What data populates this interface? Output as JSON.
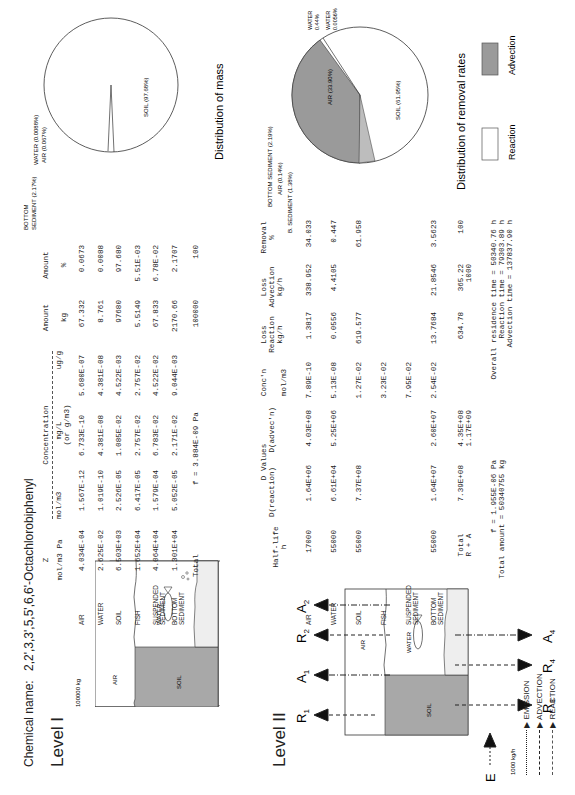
{
  "chemical_name_label": "Chemical name:",
  "chemical_name": "2,2',3,3',5,5',6,6'-Octachlorobiphenyl",
  "level1": {
    "title": "Level I",
    "diagram": {
      "total_label": "100000 kg",
      "compartments": [
        "AIR",
        "WATER",
        "SOIL"
      ]
    },
    "headers": {
      "z": "Z",
      "z_unit": "mol/m3 Pa",
      "concentration": "Concentration",
      "conc_molm3": "mol/m3",
      "conc_mgL": "mg/L",
      "conc_mgL_sub": "(or g/m3)",
      "conc_ugg": "ug/g",
      "amount_kg": "Amount",
      "amount_kg_unit": "kg",
      "amount_pct": "Amount",
      "amount_pct_unit": "%"
    },
    "rows": [
      {
        "name": "AIR",
        "name2": "",
        "z": "4.034E-04",
        "molm3": "1.567E-12",
        "mgL": "6.733E-10",
        "ugg": "5.680E-07",
        "kg": "67.332",
        "pct": "0.0673"
      },
      {
        "name": "WATER",
        "name2": "",
        "z": "2.625E-02",
        "molm3": "1.019E-10",
        "mgL": "4.381E-08",
        "ugg": "4.381E-08",
        "kg": "8.761",
        "pct": "0.0088"
      },
      {
        "name": "SOIL",
        "name2": "",
        "z": "6.503E+03",
        "molm3": "2.526E-05",
        "mgL": "1.085E-02",
        "ugg": "4.522E-03",
        "kg": "97680",
        "pct": "97.680"
      },
      {
        "name": "FISH",
        "name2": "",
        "z": "1.652E+04",
        "molm3": "6.417E-05",
        "mgL": "2.757E-02",
        "ugg": "2.757E-02",
        "kg": "5.5149",
        "pct": "5.51E-03"
      },
      {
        "name": "SUSPENDED",
        "name2": "SEDIMENT",
        "z": "4.064E+04",
        "molm3": "1.579E-04",
        "mgL": "6.783E-02",
        "ugg": "4.522E-02",
        "kg": "67.833",
        "pct": "6.78E-02"
      },
      {
        "name": "BOTTOM",
        "name2": "SEDIMENT",
        "z": "1.301E+04",
        "molm3": "5.052E-05",
        "mgL": "2.171E-02",
        "ugg": "9.044E-03",
        "kg": "2170.66",
        "pct": "2.1707"
      }
    ],
    "total": {
      "label": "Total",
      "f": "f =  3.884E-09 Pa",
      "kg": "100000",
      "pct": "100"
    },
    "pie": {
      "caption": "Distribution of mass",
      "labels": {
        "water": "WATER (0.0088%)",
        "air": "AIR (0.067%)",
        "bottom1": "BOTTOM",
        "bottom2": "SEDIMENT (2.17%)",
        "soil": "SOIL (97.68%)"
      }
    }
  },
  "level2": {
    "title": "Level II",
    "diagram": {
      "emission_label": "1000 kg/h",
      "E": "E",
      "R1": "R",
      "R1_sub": "1",
      "A1": "A",
      "A1_sub": "1",
      "R2": "R",
      "R2_sub": "2",
      "A2": "A",
      "A2_sub": "2",
      "R3": "R",
      "R3_sub": "3",
      "R4": "R",
      "R4_sub": "4",
      "A4": "A",
      "A4_sub": "4",
      "compartments": [
        "AIR",
        "WATER",
        "SOIL"
      ],
      "legend": [
        "EMISSION",
        "ADVECTION",
        "REACTION"
      ]
    },
    "headers": {
      "halflife": "Half-life",
      "halflife_unit": "h",
      "dvalues": "D Values",
      "d_reaction": "D(reaction)",
      "d_advection": "D(advec'n)",
      "conc": "Conc'n",
      "conc_unit": "mol/m3",
      "loss_reaction": "Loss",
      "loss_reaction2": "Reaction",
      "loss_reaction_unit": "kg/h",
      "loss_advection": "Loss",
      "loss_advection2": "Advection",
      "loss_advection_unit": "kg/h",
      "removal": "Removal",
      "removal_unit": "%"
    },
    "rows": [
      {
        "name": "AIR",
        "name2": "",
        "halflife": "17000",
        "dr": "1.64E+06",
        "da": "4.03E+08",
        "conc": "7.89E-10",
        "lr": "1.3817",
        "la": "338.952",
        "rem": "34.033"
      },
      {
        "name": "WATER",
        "name2": "",
        "halflife": "55000",
        "dr": "6.61E+04",
        "da": "5.25E+06",
        "conc": "5.13E-08",
        "lr": "0.0556",
        "la": "4.4105",
        "rem": "0.447"
      },
      {
        "name": "SOIL",
        "name2": "",
        "halflife": "55000",
        "dr": "7.37E+08",
        "da": "",
        "conc": "1.27E-02",
        "lr": "619.577",
        "la": "",
        "rem": "61.958"
      },
      {
        "name": "FISH",
        "name2": "",
        "halflife": "",
        "dr": "",
        "da": "",
        "conc": "3.23E-02",
        "lr": "",
        "la": "",
        "rem": ""
      },
      {
        "name": "SUSPENDED",
        "name2": "SEDIMENT",
        "halflife": "",
        "dr": "",
        "da": "",
        "conc": "7.95E-02",
        "lr": "",
        "la": "",
        "rem": ""
      },
      {
        "name": "BOTTOM",
        "name2": "SEDIMENT",
        "halflife": "55000",
        "dr": "1.64E+07",
        "da": "2.60E+07",
        "conc": "2.54E-02",
        "lr": "13.7684",
        "la": "21.8546",
        "rem": "3.5623"
      }
    ],
    "total": {
      "label": "Total",
      "label2": "R + A",
      "dr": "7.39E+08",
      "da": "4.35E+08",
      "sum": "1.17E+09",
      "lr": "634.78",
      "la": "365.22",
      "la_sum": "1000",
      "rem": "100"
    },
    "summary": {
      "f": "f =  1.955E-06 Pa",
      "total_amount": "Total amount =  50340755 kg",
      "overall": "Overall residence time =   50340.76 h",
      "reaction": "Reaction time =   79303.89 h",
      "advection": "Advection time =  137837.90 h"
    },
    "pie": {
      "caption": "Distribution of removal rates",
      "labels": {
        "bottom": "BOTTOM SEDIMENT (2.19%)",
        "air_small": "AIR (0.14%)",
        "bsed": "B. SEDIMENT (1.38%)",
        "air_big": "AIR (33.90%)",
        "soil": "SOIL (61.95%)",
        "water1a": "WATER",
        "water1b": "0.44%",
        "water2a": "WATER",
        "water2b": "0.0056%"
      },
      "legend": {
        "reaction": "Reaction",
        "advection": "Advection"
      },
      "colors": {
        "advection": "#9a9a9a",
        "reaction": "#ffffff"
      }
    }
  },
  "chart_data": [
    {
      "type": "pie",
      "title": "Distribution of mass",
      "categories": [
        "SOIL",
        "BOTTOM SEDIMENT",
        "AIR",
        "WATER"
      ],
      "values": [
        97.68,
        2.17,
        0.067,
        0.0088
      ]
    },
    {
      "type": "pie",
      "title": "Distribution of removal rates",
      "categories": [
        "SOIL (reaction)",
        "AIR (advection)",
        "B. SEDIMENT (advection)",
        "BOTTOM SEDIMENT (reaction)",
        "WATER (advection)",
        "AIR (reaction)",
        "WATER (reaction)"
      ],
      "values": [
        61.95,
        33.9,
        2.19,
        1.38,
        0.44,
        0.14,
        0.0056
      ],
      "legend": [
        "Reaction",
        "Advection"
      ]
    }
  ]
}
